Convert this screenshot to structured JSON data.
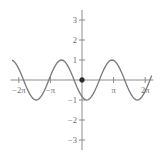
{
  "chart_data": {
    "type": "line",
    "title": "",
    "subtitle": "",
    "xlabel": "",
    "ylabel": "",
    "function": "y = cos(x)",
    "xlim": [
      -7.1,
      7.1
    ],
    "ylim": [
      -3.5,
      3.5
    ],
    "grid": false,
    "legend": null,
    "legend_position": "none",
    "x_tick_labels": [
      "−2π",
      "−π",
      "π",
      "2π"
    ],
    "x_tick_values": [
      -6.283185,
      -3.141593,
      3.141593,
      6.283185
    ],
    "y_tick_labels": [
      "3",
      "2",
      "1",
      "−1",
      "−2",
      "−3"
    ],
    "y_tick_values": [
      3,
      2,
      1,
      -1,
      -2,
      -3
    ],
    "series": [
      {
        "name": "cos(x)",
        "color": "#7a7a7a",
        "x": [
          -6.9115,
          -6.7544,
          -6.5973,
          -6.4403,
          -6.2832,
          -6.1261,
          -5.969,
          -5.8119,
          -5.6549,
          -5.4978,
          -5.3407,
          -5.1836,
          -5.0265,
          -4.8695,
          -4.7124,
          -4.5553,
          -4.3982,
          -4.2412,
          -4.0841,
          -3.927,
          -3.7699,
          -3.6128,
          -3.4558,
          -3.2987,
          -3.1416,
          -2.9845,
          -2.8274,
          -2.6704,
          -2.5133,
          -2.3562,
          -2.1991,
          -2.042,
          -1.885,
          -1.7279,
          -1.5708,
          -1.4137,
          -1.2566,
          -1.0996,
          -0.9425,
          -0.7854,
          -0.6283,
          -0.4712,
          -0.3142,
          -0.1571,
          0.0,
          0.1571,
          0.3142,
          0.4712,
          0.6283,
          0.7854,
          0.9425,
          1.0996,
          1.2566,
          1.4137,
          1.5708,
          1.7279,
          1.885,
          2.042,
          2.1991,
          2.3562,
          2.5133,
          2.6704,
          2.8274,
          2.9845,
          3.1416,
          3.2987,
          3.4558,
          3.6128,
          3.7699,
          3.927,
          4.0841,
          4.2412,
          4.3982,
          4.5553,
          4.7124,
          4.8695,
          5.0265,
          5.1836,
          5.3407,
          5.4978,
          5.6549,
          5.8119,
          5.969,
          6.1261,
          6.2832,
          6.4403,
          6.5973,
          6.7544,
          6.9115
        ],
        "y": [
          0.9808,
          0.9239,
          0.8315,
          0.7071,
          0.5556,
          0.3827,
          0.1951,
          0.0,
          -0.1951,
          -0.3827,
          -0.5556,
          -0.7071,
          -0.8315,
          -0.9239,
          -0.9808,
          -1.0,
          -0.9808,
          -0.9239,
          -0.8315,
          -0.7071,
          -0.5556,
          -0.3827,
          -0.1951,
          0.0,
          0.1951,
          0.3827,
          0.5556,
          0.7071,
          0.8315,
          0.9239,
          0.9808,
          1.0,
          0.9808,
          0.9239,
          0.8315,
          0.7071,
          0.5556,
          0.3827,
          0.1951,
          0.0,
          -0.1951,
          -0.3827,
          -0.5556,
          -0.7071,
          -0.8315,
          -0.9239,
          -0.9808,
          -1.0,
          -0.9808,
          -0.9239,
          -0.8315,
          -0.7071,
          -0.5556,
          -0.3827,
          -0.1951,
          0.0,
          0.1951,
          0.3827,
          0.5556,
          0.7071,
          0.8315,
          0.9239,
          0.9808,
          1.0,
          0.9808,
          0.9239,
          0.8315,
          0.7071,
          0.5556,
          0.3827,
          0.1951,
          0.0,
          -0.1951,
          -0.3827,
          -0.5556,
          -0.7071,
          -0.8315,
          -0.9239,
          -0.9808,
          -1.0,
          -0.9808,
          -0.9239,
          -0.8315,
          -0.7071,
          -0.5556,
          -0.3827,
          -0.1951,
          0.0,
          0.1951
        ]
      }
    ],
    "annotations": [
      {
        "name": "origin-point",
        "x": 0,
        "y": 0,
        "marker": "dot",
        "color": "#2b2b2b",
        "label": ""
      }
    ]
  }
}
